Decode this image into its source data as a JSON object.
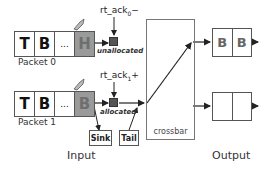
{
  "packets": [
    {
      "label": "Packet 0",
      "cells": [
        "T",
        "B",
        "...",
        "H"
      ],
      "ack": {
        "base": "rt_ack",
        "sub": "0",
        "suffix": "−"
      },
      "state": "unallocated"
    },
    {
      "label": "Packet 1",
      "cells": [
        "T",
        "B",
        "...",
        "B"
      ],
      "ack": {
        "base": "rt_ack",
        "sub": "1",
        "suffix": "+"
      },
      "state": "allocated"
    }
  ],
  "sink_label": "Sink",
  "tail_label": "Tail",
  "crossbar_label": "crossbar",
  "outputs": [
    {
      "cells": [
        "B",
        "B"
      ]
    },
    {
      "cells": [
        "",
        ""
      ]
    }
  ],
  "section_labels": {
    "input": "Input",
    "output": "Output"
  },
  "colors": {
    "head_cell": "#9a9a9a",
    "square": "#555555",
    "line": "#222222"
  }
}
